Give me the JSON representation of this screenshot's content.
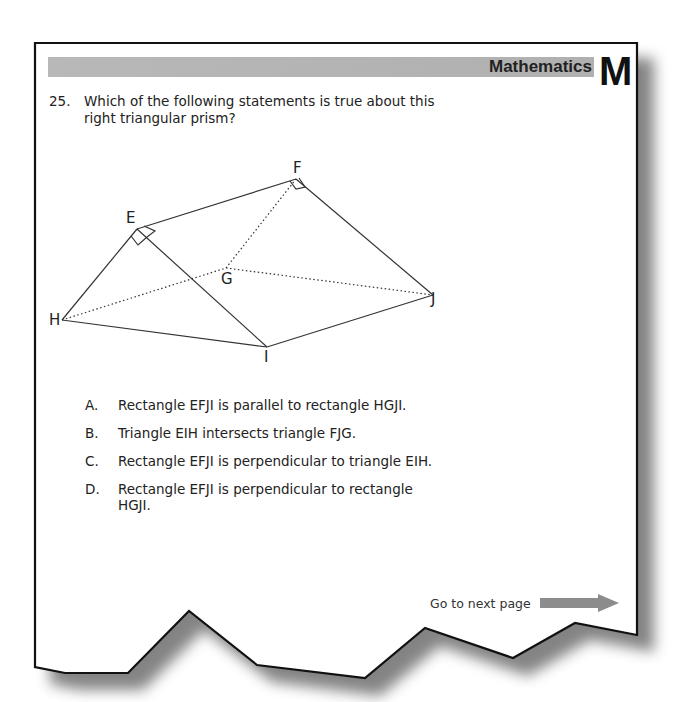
{
  "header": {
    "subject": "Mathematics",
    "section_letter": "M",
    "bar_color": "#b3b3b3"
  },
  "question": {
    "number": "25.",
    "line1": "Which of the following statements is true about this",
    "line2": "right triangular prism?"
  },
  "figure": {
    "type": "right-triangular-prism",
    "vertices": {
      "E": "E",
      "F": "F",
      "G": "G",
      "H": "H",
      "I": "I",
      "J": "J"
    }
  },
  "options": [
    {
      "letter": "A.",
      "lines": [
        "Rectangle EFJI is parallel to rectangle HGJI."
      ]
    },
    {
      "letter": "B.",
      "lines": [
        "Triangle EIH intersects triangle FJG."
      ]
    },
    {
      "letter": "C.",
      "lines": [
        "Rectangle EFJI is perpendicular to triangle EIH."
      ]
    },
    {
      "letter": "D.",
      "lines": [
        "Rectangle EFJI is perpendicular to rectangle",
        "HGJI."
      ]
    }
  ],
  "footer": {
    "next_label": "Go to next page",
    "arrow_color": "#8c8c8c"
  }
}
